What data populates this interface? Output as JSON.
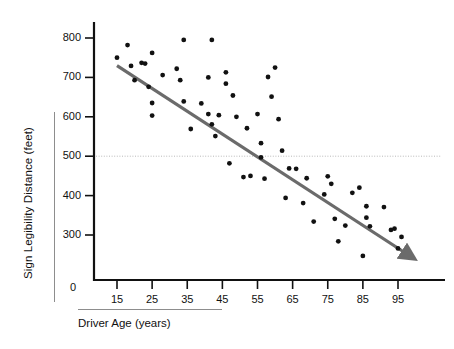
{
  "chart_data": {
    "type": "scatter",
    "title": "",
    "xlabel": "Driver Age (years)",
    "ylabel": "Sign Legibility Distance (feet)",
    "xlim": [
      8,
      104
    ],
    "ylim": [
      210,
      830
    ],
    "x_ticks": [
      15,
      25,
      35,
      45,
      55,
      65,
      75,
      85,
      95
    ],
    "y_ticks": [
      300,
      400,
      500,
      600,
      700,
      800
    ],
    "origin_label": "0",
    "grid": false,
    "legend": null,
    "reference_line": {
      "orientation": "horizontal",
      "value": 500,
      "style": "dotted",
      "color": "#b9b9b9"
    },
    "trend_line": {
      "type": "linear-fit-with-arrow",
      "color": "#6b6b6b",
      "x_start": 15,
      "y_start": 730,
      "x_end": 97,
      "y_end": 255,
      "arrow": true
    },
    "point_color": "#111111",
    "point_radius": 2.4,
    "points": [
      [
        15,
        750
      ],
      [
        18,
        782
      ],
      [
        19,
        729
      ],
      [
        20,
        693
      ],
      [
        22,
        737
      ],
      [
        23,
        735
      ],
      [
        24,
        676
      ],
      [
        25,
        762
      ],
      [
        25,
        635
      ],
      [
        25,
        603
      ],
      [
        28,
        706
      ],
      [
        32,
        722
      ],
      [
        33,
        693
      ],
      [
        34,
        795
      ],
      [
        34,
        639
      ],
      [
        36,
        569
      ],
      [
        39,
        634
      ],
      [
        41,
        700
      ],
      [
        41,
        607
      ],
      [
        42,
        795
      ],
      [
        42,
        581
      ],
      [
        43,
        551
      ],
      [
        44,
        604
      ],
      [
        46,
        713
      ],
      [
        46,
        684
      ],
      [
        47,
        482
      ],
      [
        48,
        654
      ],
      [
        49,
        600
      ],
      [
        51,
        447
      ],
      [
        52,
        571
      ],
      [
        53,
        450
      ],
      [
        55,
        607
      ],
      [
        56,
        533
      ],
      [
        56,
        497
      ],
      [
        57,
        443
      ],
      [
        58,
        701
      ],
      [
        59,
        651
      ],
      [
        60,
        725
      ],
      [
        61,
        594
      ],
      [
        62,
        514
      ],
      [
        63,
        394
      ],
      [
        64,
        469
      ],
      [
        66,
        468
      ],
      [
        68,
        381
      ],
      [
        69,
        444
      ],
      [
        71,
        334
      ],
      [
        74,
        403
      ],
      [
        75,
        449
      ],
      [
        76,
        430
      ],
      [
        77,
        341
      ],
      [
        78,
        284
      ],
      [
        80,
        324
      ],
      [
        82,
        407
      ],
      [
        84,
        420
      ],
      [
        85,
        247
      ],
      [
        86,
        373
      ],
      [
        86,
        344
      ],
      [
        87,
        322
      ],
      [
        91,
        371
      ],
      [
        93,
        313
      ],
      [
        94,
        316
      ],
      [
        95,
        266
      ],
      [
        96,
        295
      ]
    ]
  },
  "axis": {
    "y_tick_labels": [
      "800",
      "700",
      "600",
      "500",
      "400",
      "300"
    ],
    "x_tick_labels": [
      "15",
      "25",
      "35",
      "45",
      "55",
      "65",
      "75",
      "85",
      "95"
    ]
  }
}
